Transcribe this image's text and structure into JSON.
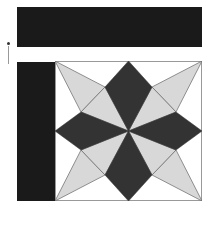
{
  "colors": {
    "dark": "#333333",
    "light": "#d8d8d8",
    "background": "#ffffff",
    "bar": "#1a1a1a",
    "stroke": "#666666"
  },
  "elements": {
    "top_bar": {
      "label": ""
    },
    "left_bar": {
      "label": ""
    },
    "tile": {
      "pattern": "eight-point-star",
      "size": [
        147,
        140
      ]
    }
  }
}
